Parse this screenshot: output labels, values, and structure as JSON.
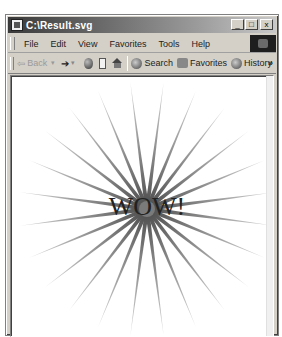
{
  "window": {
    "title": "C:\\Result.svg",
    "caption_buttons": {
      "minimize": "_",
      "maximize": "□",
      "close": "x"
    }
  },
  "menubar": {
    "items": [
      {
        "label": "File"
      },
      {
        "label": "Edit"
      },
      {
        "label": "View"
      },
      {
        "label": "Favorites"
      },
      {
        "label": "Tools"
      },
      {
        "label": "Help"
      }
    ]
  },
  "toolbar": {
    "back_label": "Back",
    "back_icon": "back-arrow-icon",
    "forward_icon": "forward-arrow-icon",
    "stop_icon": "stop-icon",
    "refresh_icon": "refresh-icon",
    "home_icon": "home-icon",
    "search_label": "Search",
    "favorites_label": "Favorites",
    "history_label": "History",
    "overflow_label": "»"
  },
  "document": {
    "text": "WOW!",
    "colors": {
      "ray_inner": "#4a4a4a",
      "ray_outer": "#d8d8d8",
      "text": "#222222",
      "background": "#ffffff"
    },
    "burst": {
      "rays": 24,
      "center_x": 136,
      "center_y": 133,
      "radius": 128
    }
  }
}
